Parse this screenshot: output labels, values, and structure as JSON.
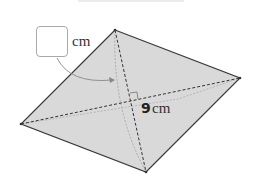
{
  "diagram": {
    "shape": "rhombus",
    "fill_color": "#d9d9d9",
    "edge_color": "#3a3a3a",
    "vertices": {
      "top": [
        115,
        30
      ],
      "right": [
        240,
        78
      ],
      "bottom": [
        146,
        172
      ],
      "left": [
        21,
        124
      ]
    },
    "diagonals": "dashed",
    "right_angle_marker": true,
    "fold_arrow": true,
    "answer_box": {
      "value": "",
      "unit": "cm"
    },
    "given_diagonal": {
      "value": "9",
      "unit": "cm"
    }
  }
}
